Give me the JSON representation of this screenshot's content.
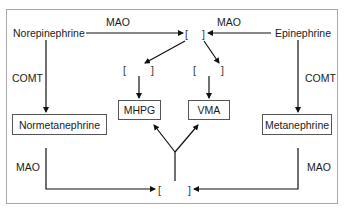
{
  "diagram": {
    "nodes": {
      "norepinephrine": "Norepinephrine",
      "epinephrine": "Epinephrine",
      "normetanephrine": "Normetanephrine",
      "metanephrine": "Metanephrine",
      "mhpg": "MHPG",
      "vma": "VMA"
    },
    "enzymes": {
      "mao_top_left": "MAO",
      "mao_top_right": "MAO",
      "comt_left": "COMT",
      "comt_right": "COMT",
      "mao_bottom_left": "MAO",
      "mao_bottom_right": "MAO"
    },
    "blanks": {
      "open": "[",
      "close": "]"
    }
  }
}
